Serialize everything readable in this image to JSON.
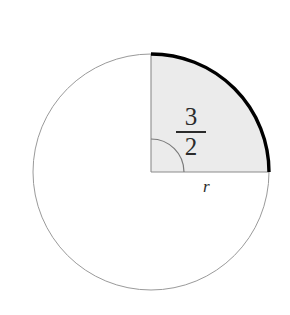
{
  "figure": {
    "type": "geometry-diagram",
    "background_color": "#ffffff",
    "width": 290,
    "height": 315,
    "circle": {
      "center_x": 151,
      "center_y": 172,
      "radius": 118,
      "stroke_color": "#9a9a9a",
      "stroke_width": 1,
      "fill": "none"
    },
    "sector": {
      "start_angle_deg": 0,
      "end_angle_deg": 90,
      "fill_color": "#ebebeb",
      "edge_stroke_color": "#8c8c8c",
      "edge_stroke_width": 1
    },
    "highlight_arc": {
      "stroke_color": "#000000",
      "stroke_width": 3.4,
      "start_angle_deg": 0,
      "end_angle_deg": 90
    },
    "angle_arc": {
      "radius": 33,
      "stroke_color": "#7a7a7a",
      "stroke_width": 1.2
    },
    "labels": {
      "angle_numerator": "3",
      "angle_denominator": "2",
      "angle_value": "3/2",
      "radius_label": "r"
    },
    "colors": {
      "ink": "#2b2b2b",
      "outline": "#9a9a9a",
      "shade": "#ebebeb",
      "bold": "#000000"
    }
  }
}
